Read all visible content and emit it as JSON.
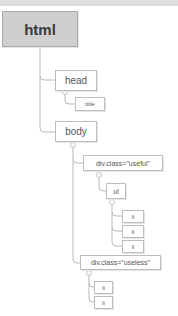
{
  "diagram": {
    "type": "dom-tree",
    "nodes": {
      "html": "html",
      "head": "head",
      "title": "title",
      "body": "body",
      "div_useful": "div.class=\"useful\"",
      "ul": "ul",
      "li_1": "li",
      "li_2": "li",
      "li_3": "li",
      "div_useless": "div.class=\"useless\"",
      "li_4": "li",
      "li_5": "li"
    },
    "edges": [
      [
        "html",
        "head"
      ],
      [
        "html",
        "body"
      ],
      [
        "head",
        "title"
      ],
      [
        "body",
        "div_useful"
      ],
      [
        "body",
        "div_useless"
      ],
      [
        "div_useful",
        "ul"
      ],
      [
        "ul",
        "li_1"
      ],
      [
        "ul",
        "li_2"
      ],
      [
        "ul",
        "li_3"
      ],
      [
        "div_useless",
        "li_4"
      ],
      [
        "div_useless",
        "li_5"
      ]
    ],
    "colors": {
      "root_fill": "#cfcfcf",
      "node_border": "#bdbdbd",
      "line": "#b5b5b5",
      "text": "#555555"
    }
  }
}
